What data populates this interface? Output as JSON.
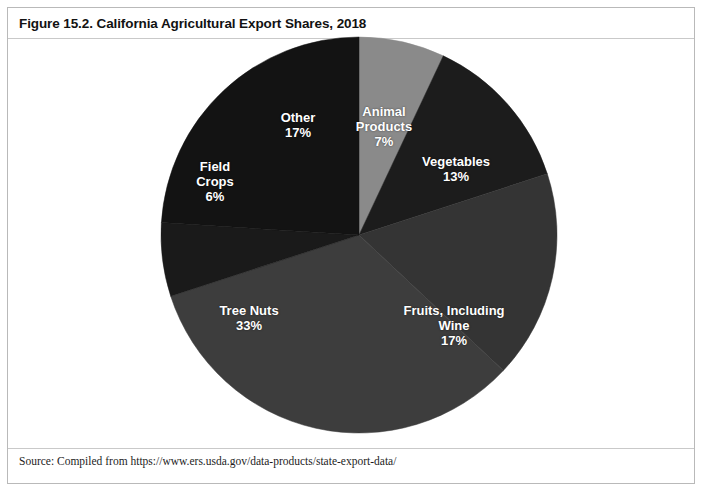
{
  "figure": {
    "title": "Figure 15.2. California Agricultural Export Shares, 2018",
    "source": "Source: Compiled from https://www.ers.usda.gov/data-products/state-export-data/"
  },
  "chart_data": {
    "type": "pie",
    "title": "California Agricultural Export Shares, 2018",
    "unit": "percent",
    "start_angle_deg": 0,
    "direction": "clockwise",
    "labels_inside": true,
    "legend": "none",
    "center": {
      "x": 351,
      "y": 227
    },
    "radius": 198,
    "categories": [
      "Animal Products",
      "Vegetables",
      "Fruits, Including Wine",
      "Tree Nuts",
      "Field Crops",
      "Other"
    ],
    "values": [
      7,
      13,
      17,
      33,
      6,
      17
    ],
    "slices": [
      {
        "name": "Animal Products",
        "label_name": "Animal\nProducts",
        "value": 7,
        "value_text": "7%",
        "color": "#8a8a8a",
        "start_deg": 0,
        "end_deg": 25.2
      },
      {
        "name": "Vegetables",
        "label_name": "Vegetables",
        "value": 13,
        "value_text": "13%",
        "color": "#1c1c1c",
        "start_deg": 25.2,
        "end_deg": 72.0
      },
      {
        "name": "Fruits, Including Wine",
        "label_name": "Fruits, Including\nWine",
        "value": 17,
        "value_text": "17%",
        "color": "#343434",
        "start_deg": 72.0,
        "end_deg": 133.2
      },
      {
        "name": "Tree Nuts",
        "label_name": "Tree Nuts",
        "value": 33,
        "value_text": "33%",
        "color": "#3d3d3d",
        "start_deg": 133.2,
        "end_deg": 252.0
      },
      {
        "name": "Field Crops",
        "label_name": "Field\nCrops",
        "value": 6,
        "value_text": "6%",
        "color": "#1a1a1a",
        "start_deg": 252.0,
        "end_deg": 273.6
      },
      {
        "name": "Other",
        "label_name": "Other",
        "value": 17,
        "value_text": "17%",
        "color": "#131313",
        "start_deg": 273.6,
        "end_deg": 360.0
      }
    ]
  }
}
